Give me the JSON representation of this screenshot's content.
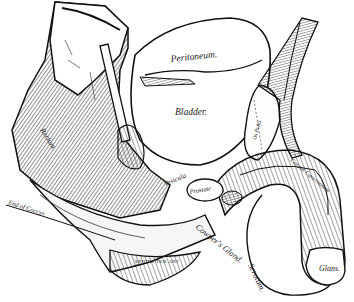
{
  "figure": {
    "type": "anatomical engraving",
    "colors": {
      "ink": "#111111",
      "paper": "#ffffff",
      "shade": "#555555"
    }
  },
  "labels": {
    "peritoneum": "Peritoneum.",
    "bladder": "Bladder.",
    "rectum": "Rectum",
    "vesicula": "Vesicula",
    "prostate": "Prostate",
    "coccyx": "End of Coccyx",
    "sphincter": "SPHINCTER ANI",
    "cowpers_gland": "Cowper's Gland.",
    "scrotum": "Scrotum.",
    "glans": "Glans.",
    "corpus_cavernosum": "Corpus Cavernosum",
    "corpus_spongiosum": "Corpus Spongiosum",
    "pubes": "Os Pubis"
  }
}
